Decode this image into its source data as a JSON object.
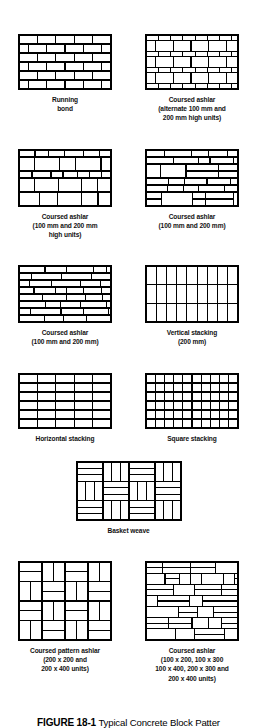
{
  "figure": {
    "number": "FIGURE 18-1",
    "title": "Typical Concrete Block Patter"
  },
  "patterns": [
    {
      "id": "running-bond",
      "caption": "Running\nbond",
      "type": "running",
      "rows": 6,
      "cols": 5,
      "panel_w": 92,
      "panel_h": 54
    },
    {
      "id": "coursed-ashlar-alternate",
      "caption": "Coursed ashlar\n(alternate 100 mm and\n200 mm high units)",
      "type": "alternating-courses",
      "courses": [
        100,
        200,
        100,
        200,
        100,
        200,
        100
      ],
      "panel_w": 92,
      "panel_h": 54
    },
    {
      "id": "coursed-ashlar-100-200-high",
      "caption": "Coursed ashlar\n(100 mm and 200 mm\nhigh units)",
      "type": "mixed-courses",
      "courses": [
        100,
        200,
        100,
        200,
        200
      ],
      "panel_w": 92,
      "panel_h": 56
    },
    {
      "id": "coursed-ashlar-100-200",
      "caption": "Coursed ashlar\n(100 mm and 200 mm)",
      "type": "random-ashlar-a",
      "panel_w": 92,
      "panel_h": 56
    },
    {
      "id": "coursed-ashlar-100-200-b",
      "caption": "Coursed ashlar\n(100 mm and 200 mm)",
      "type": "random-ashlar-b",
      "panel_w": 92,
      "panel_h": 56
    },
    {
      "id": "vertical-stacking",
      "caption": "Vertical stacking\n(200 mm)",
      "type": "vertical-stack",
      "rows": 3,
      "cols": 9,
      "panel_w": 92,
      "panel_h": 56
    },
    {
      "id": "horizontal-stacking",
      "caption": "Horizontal stacking",
      "type": "grid-stack",
      "rows": 6,
      "cols": 5,
      "panel_w": 92,
      "panel_h": 54
    },
    {
      "id": "square-stacking",
      "caption": "Square stacking",
      "type": "grid-stack",
      "rows": 6,
      "cols": 10,
      "panel_w": 92,
      "panel_h": 54
    },
    {
      "id": "basket-weave",
      "caption": "Basket weave",
      "type": "basket-weave",
      "blocks_x": 4,
      "blocks_y": 3,
      "strips": 3,
      "panel_w": 104,
      "panel_h": 58
    },
    {
      "id": "coursed-pattern-ashlar",
      "caption": "Coursed pattern ashlar\n(200 x 200 and\n200 x 400 units)",
      "type": "pinwheel",
      "blocks_x": 4,
      "blocks_y": 4,
      "panel_w": 92,
      "panel_h": 78
    },
    {
      "id": "coursed-ashlar-multi",
      "caption": "Coursed ashlar\n(100 x 200, 100 x 300\n100 x 400, 200 x 300 and\n200 x 400 units)",
      "type": "random-rubble",
      "panel_w": 92,
      "panel_h": 78
    }
  ],
  "colors": {
    "line": "#000000",
    "fill": "#ffffff",
    "mortar": "#ffffff",
    "text": "#000000"
  }
}
